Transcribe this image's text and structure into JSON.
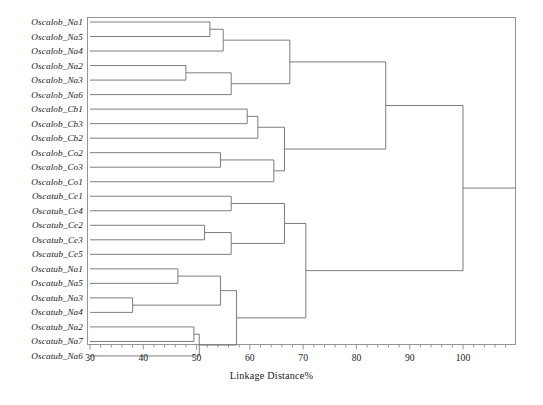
{
  "figure": {
    "type": "dendrogram",
    "axis_title": "Linkage Distance%",
    "frame_color": "#8a8a8a",
    "line_color": "#6e6e6e",
    "text_color": "#1a1a1a"
  },
  "axis": {
    "ticks_major": [
      30,
      40,
      50,
      60,
      70,
      80,
      90,
      100
    ],
    "tick_labels": [
      "30",
      "40",
      "50",
      "60",
      "70",
      "80",
      "90",
      "100"
    ],
    "minor_per_major": 5,
    "range": [
      30,
      108
    ]
  },
  "leaves": [
    "Oscalob_Na1",
    "Oscalob_Na5",
    "Oscalob_Na4",
    "Oscalob_Na2",
    "Oscalob_Na3",
    "Oscalob_Na6",
    "Oscalob_Cb1",
    "Oscalob_Cb3",
    "Oscalob_Cb2",
    "Oscalob_Co2",
    "Oscalob_Co3",
    "Oscalob_Co1",
    "Oscatub_Ce1",
    "Oscatub_Ce4",
    "Oscatub_Ce2",
    "Oscatub_Ce3",
    "Oscatub_Ce5",
    "Oscatub_Na1",
    "Oscatub_Na5",
    "Oscatub_Na3",
    "Oscatub_Na4",
    "Oscatub_Na2",
    "Oscatub_Na7",
    "Oscatub_Na6"
  ],
  "chart_data": {
    "type": "dendrogram",
    "title": "",
    "xlabel": "Linkage Distance%",
    "ylabel": "",
    "xlim": [
      30,
      108
    ],
    "grid": false,
    "legend": "none",
    "labels": [
      "Oscalob_Na1",
      "Oscalob_Na5",
      "Oscalob_Na4",
      "Oscalob_Na2",
      "Oscalob_Na3",
      "Oscalob_Na6",
      "Oscalob_Cb1",
      "Oscalob_Cb3",
      "Oscalob_Cb2",
      "Oscalob_Co2",
      "Oscalob_Co3",
      "Oscalob_Co1",
      "Oscatub_Ce1",
      "Oscatub_Ce4",
      "Oscatub_Ce2",
      "Oscatub_Ce3",
      "Oscatub_Ce5",
      "Oscatub_Na1",
      "Oscatub_Na5",
      "Oscatub_Na3",
      "Oscatub_Na4",
      "Oscatub_Na2",
      "Oscatub_Na7",
      "Oscatub_Na6"
    ],
    "merges": [
      {
        "id": "m1",
        "left": "Oscalob_Na1",
        "right": "Oscalob_Na5",
        "distance": 52.5
      },
      {
        "id": "m2",
        "left": "m1",
        "right": "Oscalob_Na4",
        "distance": 55.0
      },
      {
        "id": "m3",
        "left": "Oscalob_Na2",
        "right": "Oscalob_Na3",
        "distance": 48.0
      },
      {
        "id": "m4",
        "left": "m3",
        "right": "Oscalob_Na6",
        "distance": 56.5
      },
      {
        "id": "m5",
        "left": "m2",
        "right": "m4",
        "distance": 67.5
      },
      {
        "id": "m6",
        "left": "Oscalob_Cb1",
        "right": "Oscalob_Cb3",
        "distance": 59.5
      },
      {
        "id": "m7",
        "left": "m6",
        "right": "Oscalob_Cb2",
        "distance": 61.5
      },
      {
        "id": "m8",
        "left": "Oscalob_Co2",
        "right": "Oscalob_Co3",
        "distance": 54.5
      },
      {
        "id": "m9",
        "left": "m8",
        "right": "Oscalob_Co1",
        "distance": 64.5
      },
      {
        "id": "m10",
        "left": "m7",
        "right": "m9",
        "distance": 66.5
      },
      {
        "id": "m11",
        "left": "Oscatub_Ce1",
        "right": "Oscatub_Ce4",
        "distance": 56.5
      },
      {
        "id": "m12",
        "left": "Oscatub_Ce2",
        "right": "Oscatub_Ce3",
        "distance": 51.5
      },
      {
        "id": "m13",
        "left": "m12",
        "right": "Oscatub_Ce5",
        "distance": 56.5
      },
      {
        "id": "m14",
        "left": "m11",
        "right": "m13",
        "distance": 66.5
      },
      {
        "id": "m15",
        "left": "Oscatub_Na1",
        "right": "Oscatub_Na5",
        "distance": 46.5
      },
      {
        "id": "m16",
        "left": "Oscatub_Na3",
        "right": "Oscatub_Na4",
        "distance": 38.0
      },
      {
        "id": "m17",
        "left": "m15",
        "right": "m16",
        "distance": 54.5
      },
      {
        "id": "m18",
        "left": "Oscatub_Na2",
        "right": "Oscatub_Na7",
        "distance": 49.5
      },
      {
        "id": "m19",
        "left": "m18",
        "right": "Oscatub_Na6",
        "distance": 50.5
      },
      {
        "id": "m20",
        "left": "m17",
        "right": "m19",
        "distance": 57.5
      },
      {
        "id": "m21",
        "left": "m14",
        "right": "m20",
        "distance": 70.5
      },
      {
        "id": "m22",
        "left": "m5",
        "right": "m10",
        "distance": 85.5
      },
      {
        "id": "m23",
        "left": "m22",
        "right": "m21",
        "distance": 100.0
      }
    ]
  }
}
